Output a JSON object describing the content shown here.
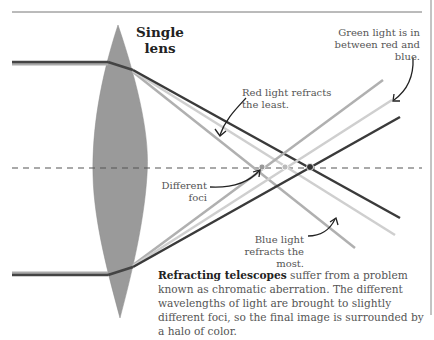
{
  "diagram": {
    "title": "Single lens",
    "title_line1": "Single",
    "title_line2": "lens",
    "labels": {
      "red": "Red light refracts the least.",
      "green": "Green light is in between red and blue.",
      "foci": "Different foci",
      "blue": "Blue light refracts the most."
    },
    "colors": {
      "red_ray": "#3a3a3a",
      "green_ray": "#cfcfcf",
      "blue_ray": "#b0b0b0",
      "lens": "#9a9a9a",
      "axis": "#555555",
      "rule": "#777777"
    },
    "foci_points": [
      {
        "name": "blue",
        "x": 262,
        "y": 167
      },
      {
        "name": "green",
        "x": 285,
        "y": 167
      },
      {
        "name": "red",
        "x": 310,
        "y": 167
      }
    ]
  },
  "caption": {
    "bold": "Refracting telescopes",
    "text": " suffer from a problem known as chromatic aberration. The different wavelengths of light are brought to slightly different foci, so the final image is surrounded by a halo of color."
  }
}
